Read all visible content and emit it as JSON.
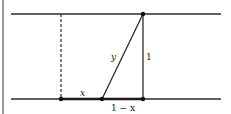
{
  "diagram": {
    "labels": {
      "y": "y",
      "height": "1",
      "x": "x",
      "one_minus_x": "1 − x"
    },
    "colors": {
      "line": "#2a2a2a",
      "background": "#ffffff"
    }
  }
}
